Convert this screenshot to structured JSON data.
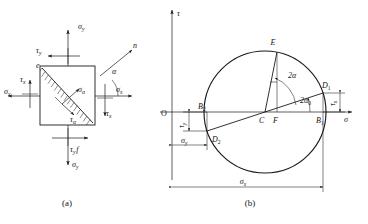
{
  "figure": {
    "title_a": "(a)",
    "title_b": "(b)",
    "panel_a": {
      "name": "stress-element",
      "labels": {
        "sigma_y_top": "σ",
        "sigma_y_top_sub": "y",
        "sigma_y_bottom": "σ",
        "sigma_y_bottom_sub": "y",
        "tau_y_top": "τ",
        "tau_y_top_sub": "y",
        "tau_y_bottom": "τ",
        "tau_y_bottom_sub": "y",
        "tau_y_bottom_extra": "f",
        "sigma_x_left": "σ",
        "sigma_x_left_sub": "x",
        "sigma_x_right": "σ",
        "sigma_x_right_sub": "x",
        "tau_x_left": "τ",
        "tau_x_left_sub": "x",
        "tau_x_right": "τ",
        "tau_x_right_sub": "x",
        "sigma_alpha": "σ",
        "sigma_alpha_sub": "α",
        "tau_alpha": "τ",
        "tau_alpha_sub": "α",
        "normal_n": "n",
        "angle_alpha": "α",
        "vertex_e": "e"
      }
    },
    "panel_b": {
      "name": "mohr-circle",
      "axes": {
        "vertical_label": "τ",
        "horizontal_label": "σ",
        "origin_label": "O"
      },
      "points": {
        "E": "E",
        "D1": "D",
        "D1_sub": "1",
        "D2": "D",
        "D2_sub": "2",
        "B1": "B",
        "B1_sub": "1",
        "B2": "B",
        "B2_sub": "2",
        "C": "C",
        "F": "F"
      },
      "angles": {
        "two_alpha": "2α",
        "two_alpha_zero": "2α",
        "two_alpha_zero_sub": "0"
      },
      "dimensions": {
        "tau_x": "τ",
        "tau_x_sub": "x",
        "tau_y": "τ",
        "tau_y_sub": "y",
        "sigma_y": "σ",
        "sigma_y_sub": "y",
        "sigma_x": "σ",
        "sigma_x_sub": "x"
      }
    },
    "colors": {
      "ink": "#1a1a1a",
      "background": "#ffffff"
    }
  }
}
